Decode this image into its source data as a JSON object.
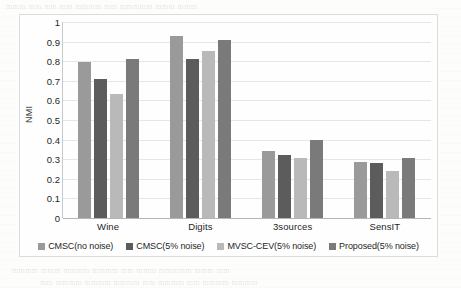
{
  "chart_data": {
    "type": "bar",
    "title": "",
    "xlabel": "",
    "ylabel": "NMI",
    "ylim": [
      0,
      1
    ],
    "ytick_labels": [
      "1",
      "0.9",
      "0.8",
      "0.7",
      "0.6",
      "0.5",
      "0.4",
      "0.3",
      "0.2",
      "0.1",
      "0"
    ],
    "ytick_values": [
      1,
      0.9,
      0.8,
      0.7,
      0.6,
      0.5,
      0.4,
      0.3,
      0.2,
      0.1,
      0
    ],
    "grid": true,
    "legend_position": "bottom",
    "categories": [
      "Wine",
      "Digits",
      "3sources",
      "SensIT"
    ],
    "series": [
      {
        "name": "CMSC(no noise)",
        "color": "#9a9a9a",
        "values": [
          0.795,
          0.93,
          0.34,
          0.285
        ]
      },
      {
        "name": "CMSC(5% noise)",
        "color": "#5c5c5c",
        "values": [
          0.71,
          0.81,
          0.32,
          0.28
        ]
      },
      {
        "name": "MVSC-CEV(5% noise)",
        "color": "#b9b9b9",
        "values": [
          0.635,
          0.85,
          0.305,
          0.24
        ]
      },
      {
        "name": "Proposed(5% noise)",
        "color": "#7a7a7a",
        "values": [
          0.81,
          0.91,
          0.4,
          0.305
        ]
      }
    ]
  },
  "background": {
    "ghost_lines": [
      "mmm mm  mm mm        mmmm mm  mmmmm  mmm mmm",
      "mm  mmmmm   mmmm mmm mm mmmmmm   mmm mmmm",
      "mmmm mmm  mmmm mmmm  mm mmm mmmmm mmm mm",
      "mm mmmm mmmm  mmmm mm mmmm  mm mmmm mmmm"
    ]
  }
}
